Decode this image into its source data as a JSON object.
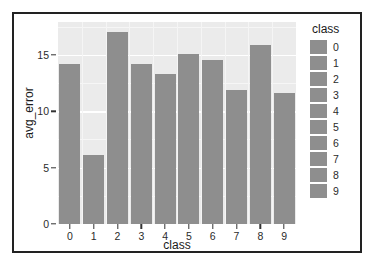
{
  "chart_data": {
    "type": "bar",
    "title": "",
    "subtitle": "",
    "xlabel": "class",
    "ylabel": "avg_error",
    "categories": [
      "0",
      "1",
      "2",
      "3",
      "4",
      "5",
      "6",
      "7",
      "8",
      "9"
    ],
    "values": [
      14.2,
      6.1,
      17.0,
      14.2,
      13.3,
      15.1,
      14.5,
      11.9,
      15.9,
      11.6
    ],
    "series": [
      {
        "name": "avg_error",
        "values": [
          14.2,
          6.1,
          17.0,
          14.2,
          13.3,
          15.1,
          14.5,
          11.9,
          15.9,
          11.6
        ]
      }
    ],
    "ylim": [
      0,
      17.9
    ],
    "xlim_categories": 10,
    "y_ticks": [
      0,
      5,
      10,
      15
    ],
    "y_tick_labels": [
      "0",
      "5",
      "10",
      "15"
    ],
    "x_tick_labels": [
      "0",
      "1",
      "2",
      "3",
      "4",
      "5",
      "6",
      "7",
      "8",
      "9"
    ],
    "grid": true,
    "grid_minor_y": [
      2.5,
      7.5,
      12.5,
      17.5
    ],
    "legend_position": "right",
    "legend_title": "class",
    "legend_entries": [
      {
        "label": "0",
        "color": "#8e8e8e"
      },
      {
        "label": "1",
        "color": "#8e8e8e"
      },
      {
        "label": "2",
        "color": "#8e8e8e"
      },
      {
        "label": "3",
        "color": "#8e8e8e"
      },
      {
        "label": "4",
        "color": "#8e8e8e"
      },
      {
        "label": "5",
        "color": "#8e8e8e"
      },
      {
        "label": "6",
        "color": "#8e8e8e"
      },
      {
        "label": "7",
        "color": "#8e8e8e"
      },
      {
        "label": "8",
        "color": "#8e8e8e"
      },
      {
        "label": "9",
        "color": "#8e8e8e"
      }
    ],
    "colors": {
      "bar": "#8e8e8e",
      "panel_background": "#ebebeb",
      "gridline": "#ffffff",
      "figure_border": "#222222",
      "text": "#1a1a1a",
      "figure_background": "#ffffff"
    }
  }
}
